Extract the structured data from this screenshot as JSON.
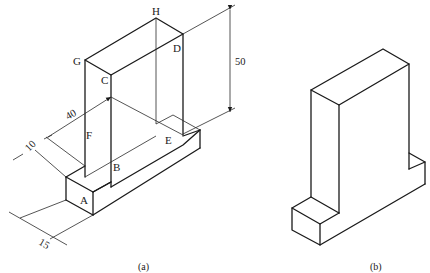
{
  "figure_a": {
    "caption": "(a)",
    "vertex_labels": {
      "A": "A",
      "B": "B",
      "C": "C",
      "D": "D",
      "E": "E",
      "F": "F",
      "G": "G",
      "H": "H"
    },
    "dimensions": {
      "height": "50",
      "depth": "40",
      "base_step": "10",
      "base_width": "15"
    }
  },
  "figure_b": {
    "caption": "(b)"
  },
  "colors": {
    "line": "#1a1a1a",
    "background": "#ffffff"
  }
}
